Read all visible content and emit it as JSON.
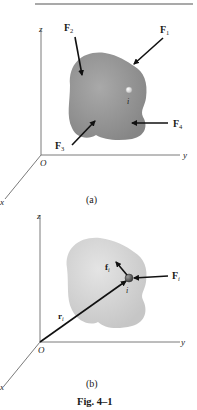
{
  "figure": {
    "caption": "Fig. 4–1",
    "panels": [
      {
        "id": "a",
        "label": "(a)",
        "axes": {
          "z": "z",
          "y": "y",
          "x": "x",
          "origin": "O"
        },
        "particle": "i",
        "forces": [
          {
            "name": "F",
            "sub": "1"
          },
          {
            "name": "F",
            "sub": "2"
          },
          {
            "name": "F",
            "sub": "3"
          },
          {
            "name": "F",
            "sub": "4"
          }
        ],
        "body_color": "#8a8a8a"
      },
      {
        "id": "b",
        "label": "(b)",
        "axes": {
          "z": "z",
          "y": "y",
          "x": "x",
          "origin": "O"
        },
        "particle": "i",
        "vectors": [
          {
            "name": "r",
            "sub": "i"
          },
          {
            "name": "f",
            "sub": "i"
          },
          {
            "name": "F",
            "sub": "i"
          }
        ],
        "body_color": "#d0d0d0"
      }
    ]
  },
  "colors": {
    "rule": "#555555",
    "axis": "#6b6b6b",
    "arrow": "#111111"
  }
}
